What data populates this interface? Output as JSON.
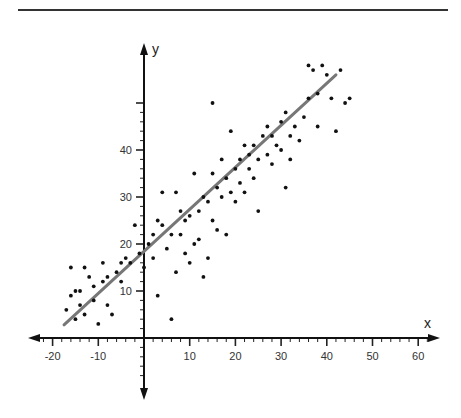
{
  "chart_data": {
    "type": "scatter",
    "title": "",
    "xlabel": "x",
    "ylabel": "y",
    "xlim": [
      -25,
      65
    ],
    "ylim": [
      -10,
      60
    ],
    "grid": false,
    "legend": null,
    "x_ticks": [
      -20,
      -10,
      10,
      20,
      30,
      40,
      50,
      60
    ],
    "y_ticks": [
      10,
      20,
      30,
      40
    ],
    "y_unlabeled_ticks": [
      50
    ],
    "trend_line": {
      "x1": -17.5,
      "y1": 2.8,
      "x2": 42,
      "y2": 56,
      "color": "#777777"
    },
    "series": [
      {
        "name": "observations",
        "points": [
          [
            -17,
            6
          ],
          [
            -16,
            15
          ],
          [
            -16,
            9
          ],
          [
            -15,
            10
          ],
          [
            -15,
            4
          ],
          [
            -14,
            7
          ],
          [
            -14,
            10
          ],
          [
            -13,
            15
          ],
          [
            -13,
            5
          ],
          [
            -12,
            13
          ],
          [
            -11,
            8
          ],
          [
            -11,
            11
          ],
          [
            -10,
            3
          ],
          [
            -9,
            12
          ],
          [
            -9,
            16
          ],
          [
            -8,
            7
          ],
          [
            -8,
            13
          ],
          [
            -7,
            5
          ],
          [
            -6,
            14
          ],
          [
            -5,
            16
          ],
          [
            -5,
            12
          ],
          [
            -4,
            17
          ],
          [
            -3,
            16
          ],
          [
            -2,
            24
          ],
          [
            -1,
            18
          ],
          [
            0,
            15
          ],
          [
            1,
            20
          ],
          [
            2,
            17
          ],
          [
            2,
            22
          ],
          [
            3,
            9
          ],
          [
            3,
            25
          ],
          [
            4,
            24
          ],
          [
            4,
            31
          ],
          [
            5,
            19
          ],
          [
            6,
            4
          ],
          [
            6,
            22
          ],
          [
            7,
            14
          ],
          [
            7,
            31
          ],
          [
            8,
            22
          ],
          [
            8,
            27
          ],
          [
            9,
            18
          ],
          [
            9,
            25
          ],
          [
            10,
            16
          ],
          [
            10,
            26
          ],
          [
            11,
            35
          ],
          [
            11,
            20
          ],
          [
            12,
            21
          ],
          [
            12,
            27
          ],
          [
            13,
            13
          ],
          [
            13,
            30
          ],
          [
            14,
            17
          ],
          [
            14,
            29
          ],
          [
            15,
            50
          ],
          [
            15,
            25
          ],
          [
            15,
            35
          ],
          [
            16,
            23
          ],
          [
            16,
            32
          ],
          [
            17,
            30
          ],
          [
            17,
            38
          ],
          [
            18,
            34
          ],
          [
            18,
            22
          ],
          [
            19,
            44
          ],
          [
            19,
            31
          ],
          [
            20,
            36
          ],
          [
            20,
            29
          ],
          [
            21,
            33
          ],
          [
            21,
            38
          ],
          [
            22,
            41
          ],
          [
            22,
            31
          ],
          [
            23,
            36
          ],
          [
            23,
            39
          ],
          [
            24,
            34
          ],
          [
            24,
            41
          ],
          [
            25,
            27
          ],
          [
            25,
            38
          ],
          [
            26,
            43
          ],
          [
            27,
            39
          ],
          [
            27,
            45
          ],
          [
            28,
            37
          ],
          [
            28,
            43
          ],
          [
            29,
            41
          ],
          [
            30,
            46
          ],
          [
            30,
            40
          ],
          [
            31,
            48
          ],
          [
            31,
            32
          ],
          [
            32,
            43
          ],
          [
            32,
            38
          ],
          [
            33,
            45
          ],
          [
            34,
            42
          ],
          [
            35,
            47
          ],
          [
            36,
            51
          ],
          [
            36,
            58
          ],
          [
            37,
            57
          ],
          [
            38,
            52
          ],
          [
            38,
            45
          ],
          [
            39,
            58
          ],
          [
            40,
            56
          ],
          [
            41,
            51
          ],
          [
            42,
            44
          ],
          [
            43,
            57
          ],
          [
            44,
            50
          ],
          [
            45,
            51
          ]
        ],
        "color": "#111111"
      }
    ]
  }
}
